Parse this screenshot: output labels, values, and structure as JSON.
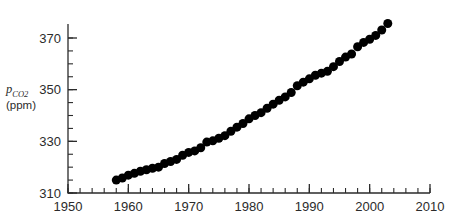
{
  "chart_data": {
    "type": "scatter",
    "title": "",
    "subtitle": "",
    "xlabel": "",
    "ylabel": "pCO2 (ppm)",
    "ylabel_symbol": "p",
    "ylabel_subscript": "CO",
    "ylabel_subscript_number": "2",
    "ylabel_units": "(ppm)",
    "xlim": [
      1950,
      2010
    ],
    "ylim": [
      310,
      375
    ],
    "grid": false,
    "legend": "none",
    "x_major_ticks": [
      1950,
      1960,
      1970,
      1980,
      1990,
      2000,
      2010
    ],
    "x_major_tick_labels": [
      "1950",
      "1960",
      "1970",
      "1980",
      "1990",
      "2000",
      "2010"
    ],
    "x_minor_tick_interval": 2,
    "y_major_ticks": [
      310,
      330,
      350,
      370
    ],
    "y_major_tick_labels": [
      "310",
      "330",
      "350",
      "370"
    ],
    "y_minor_tick_interval": 5,
    "marker": "filled-circle",
    "marker_color": "#000000",
    "marker_size_px": 9,
    "x": [
      1958,
      1959,
      1960,
      1961,
      1962,
      1963,
      1964,
      1965,
      1966,
      1967,
      1968,
      1969,
      1970,
      1971,
      1972,
      1973,
      1974,
      1975,
      1976,
      1977,
      1978,
      1979,
      1980,
      1981,
      1982,
      1983,
      1984,
      1985,
      1986,
      1987,
      1988,
      1989,
      1990,
      1991,
      1992,
      1993,
      1994,
      1995,
      1996,
      1997,
      1998,
      1999,
      2000,
      2001,
      2002,
      2003
    ],
    "values": [
      315.0,
      315.8,
      316.9,
      317.6,
      318.4,
      319.0,
      319.6,
      320.0,
      321.4,
      322.2,
      323.0,
      324.6,
      325.7,
      326.3,
      327.5,
      329.7,
      330.2,
      331.2,
      332.2,
      333.9,
      335.5,
      336.9,
      338.7,
      340.0,
      341.1,
      342.8,
      344.4,
      345.9,
      347.2,
      348.9,
      351.5,
      352.9,
      354.2,
      355.6,
      356.4,
      357.1,
      358.9,
      360.9,
      362.6,
      363.8,
      366.6,
      368.3,
      369.5,
      371.0,
      373.1,
      375.6
    ],
    "annotations": []
  },
  "geometry": {
    "plot_left_px": 68,
    "plot_right_px": 430,
    "y_top_px": 38,
    "y_bottom_px": 193
  }
}
